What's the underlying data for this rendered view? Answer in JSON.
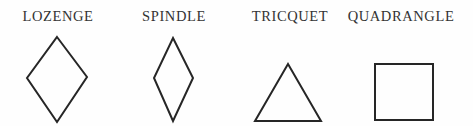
{
  "figure": {
    "ink_color": "#262626",
    "paper_color": "#fefefe",
    "items": [
      {
        "label": "LOZENGE",
        "shape": "lozenge-rhombus"
      },
      {
        "label": "SPINDLE",
        "shape": "spindle-narrow-rhombus"
      },
      {
        "label": "TRICQUET",
        "shape": "triangle"
      },
      {
        "label": "QUADRANGLE",
        "shape": "square"
      }
    ]
  }
}
